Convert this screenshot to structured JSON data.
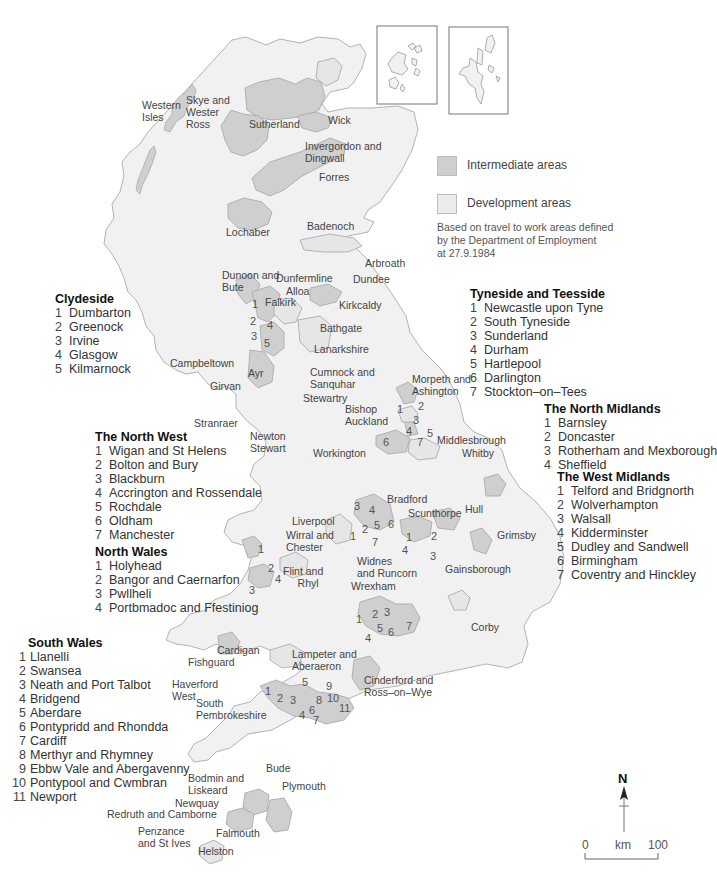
{
  "map": {
    "colors": {
      "intermediate": "#cfcfcf",
      "development": "#ececec",
      "land": "#f1f1f1",
      "border": "#a9a9a9"
    },
    "key": {
      "intermediate_label": "Intermediate areas",
      "development_label": "Development areas",
      "note_lines": [
        "Based on travel to work areas defined",
        "by the Department of Employment",
        "at 27.9.1984"
      ]
    },
    "place_labels": [
      {
        "id": "western-isles",
        "text": "Western\nIsles"
      },
      {
        "id": "skye",
        "text": "Skye and\nWester\nRoss"
      },
      {
        "id": "sutherland",
        "text": "Sutherland"
      },
      {
        "id": "wick",
        "text": "Wick"
      },
      {
        "id": "invergordon",
        "text": "Invergordon and\nDingwall"
      },
      {
        "id": "forres",
        "text": "Forres"
      },
      {
        "id": "badenoch",
        "text": "Badenoch"
      },
      {
        "id": "lochaber",
        "text": "Lochaber"
      },
      {
        "id": "arbroath",
        "text": "Arbroath"
      },
      {
        "id": "dunoon",
        "text": "Dunoon and\nBute"
      },
      {
        "id": "dunfermline",
        "text": "Dunfermline"
      },
      {
        "id": "dundee",
        "text": "Dundee"
      },
      {
        "id": "alloa",
        "text": "Alloa"
      },
      {
        "id": "falkirk",
        "text": "Falkirk"
      },
      {
        "id": "kirkcaldy",
        "text": "Kirkcaldy"
      },
      {
        "id": "bathgate",
        "text": "Bathgate"
      },
      {
        "id": "lanarkshire",
        "text": "Lanarkshire"
      },
      {
        "id": "campbeltown",
        "text": "Campbeltown"
      },
      {
        "id": "ayr",
        "text": "Ayr"
      },
      {
        "id": "girvan",
        "text": "Girvan"
      },
      {
        "id": "cumnock",
        "text": "Cumnock and\nSanquhar"
      },
      {
        "id": "stewartry",
        "text": "Stewartry"
      },
      {
        "id": "stranraer",
        "text": "Stranraer"
      },
      {
        "id": "newton-stewart",
        "text": "Newton\nStewart"
      },
      {
        "id": "morpeth",
        "text": "Morpeth and\nAshington"
      },
      {
        "id": "bishop-auckland",
        "text": "Bishop\nAuckland"
      },
      {
        "id": "middlesbrough",
        "text": "Middlesbrough"
      },
      {
        "id": "whitby",
        "text": "Whitby"
      },
      {
        "id": "workington",
        "text": "Workington"
      },
      {
        "id": "bradford",
        "text": "Bradford"
      },
      {
        "id": "scunthorpe",
        "text": "Scunthorpe"
      },
      {
        "id": "hull",
        "text": "Hull"
      },
      {
        "id": "grimsby",
        "text": "Grimsby"
      },
      {
        "id": "liverpool",
        "text": "Liverpool"
      },
      {
        "id": "wirral",
        "text": "Wirral and\nChester"
      },
      {
        "id": "widnes",
        "text": "Widnes\nand Runcorn"
      },
      {
        "id": "gainsborough",
        "text": "Gainsborough"
      },
      {
        "id": "flint",
        "text": "Flint and\n     Rhyl"
      },
      {
        "id": "wrexham",
        "text": "Wrexham"
      },
      {
        "id": "corby",
        "text": "Corby"
      },
      {
        "id": "cardigan",
        "text": "Cardigan"
      },
      {
        "id": "fishguard",
        "text": "Fishguard"
      },
      {
        "id": "lampeter",
        "text": "Lampeter and\nAberaeron"
      },
      {
        "id": "haverfordwest",
        "text": "Haverford\nWest"
      },
      {
        "id": "cinderford",
        "text": "Cinderford and\nRoss–on–Wye"
      },
      {
        "id": "south-pembrokeshire",
        "text": "South\nPembrokeshire"
      },
      {
        "id": "bude",
        "text": "Bude"
      },
      {
        "id": "bodmin",
        "text": "Bodmin and\nLiskeard"
      },
      {
        "id": "plymouth",
        "text": "Plymouth"
      },
      {
        "id": "newquay",
        "text": "Newquay"
      },
      {
        "id": "redruth",
        "text": "Redruth and Camborne"
      },
      {
        "id": "penzance",
        "text": "Penzance\nand St Ives"
      },
      {
        "id": "falmouth",
        "text": "Falmouth"
      },
      {
        "id": "helston",
        "text": "Helston"
      }
    ],
    "compass": {
      "label": "N"
    },
    "scale": {
      "start": "0",
      "unit": "km",
      "end": "100"
    }
  },
  "regions": {
    "clydeside": {
      "title": "Clydeside",
      "items": [
        "Dumbarton",
        "Greenock",
        "Irvine",
        "Glasgow",
        "Kilmarnock"
      ]
    },
    "tyneside": {
      "title": "Tyneside and Teesside",
      "items": [
        "Newcastle upon Tyne",
        "South Tyneside",
        "Sunderland",
        "Durham",
        "Hartlepool",
        "Darlington",
        "Stockton–on–Tees"
      ]
    },
    "north_midlands": {
      "title": "The North Midlands",
      "items": [
        "Barnsley",
        "Doncaster",
        "Rotherham and Mexborough",
        "Sheffield"
      ]
    },
    "west_midlands": {
      "title": "The West Midlands",
      "items": [
        "Telford and Bridgnorth",
        "Wolverhampton",
        "Walsall",
        "Kidderminster",
        "Dudley and Sandwell",
        "Birmingham",
        "Coventry and Hinckley"
      ]
    },
    "north_west": {
      "title": "The North West",
      "items": [
        "Wigan and St Helens",
        "Bolton and Bury",
        "Blackburn",
        "Accrington and Rossendale",
        "Rochdale",
        "Oldham",
        "Manchester"
      ]
    },
    "north_wales": {
      "title": "North Wales",
      "items": [
        "Holyhead",
        "Bangor and Caernarfon",
        "Pwllheli",
        "Portbmadoc and Ffestiniog"
      ]
    },
    "south_wales": {
      "title": "South Wales",
      "items": [
        "Llanelli",
        "Swansea",
        "Neath and Port Talbot",
        "Bridgend",
        "Aberdare",
        "Pontypridd and Rhondda",
        "Cardiff",
        "Merthyr and Rhymney",
        "Ebbw Vale and Abergavenny",
        "Pontypool and Cwmbran",
        "Newport"
      ]
    }
  }
}
